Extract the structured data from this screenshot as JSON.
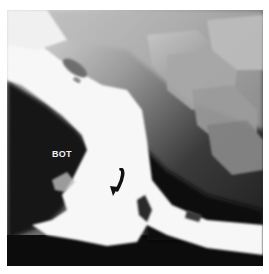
{
  "figure": {
    "type": "radiograph",
    "annotations": [
      {
        "kind": "text",
        "text": "BOT",
        "position": {
          "x": 52,
          "y": 150
        }
      },
      {
        "kind": "arrow",
        "direction": "down-left",
        "color": "#111111",
        "position": {
          "x": 115,
          "y": 180
        }
      }
    ]
  },
  "colors": {
    "background": "#ffffff",
    "soft_tissue_dark": "#111111",
    "bone_gray": "#9a9a9a",
    "barium_white": "#fafafa"
  }
}
